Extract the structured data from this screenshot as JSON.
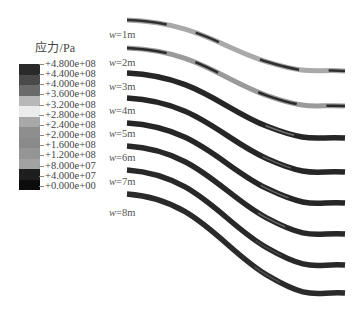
{
  "legend": {
    "title": "应力/Pa",
    "labels": [
      "+4.800e+08",
      "+4.400e+08",
      "+4.000e+08",
      "+3.600e+08",
      "+3.200e+08",
      "+2.800e+08",
      "+2.400e+08",
      "+2.000e+08",
      "+1.600e+08",
      "+1.200e+08",
      "+8.000e+07",
      "+4.000e+07",
      "+0.000e+00"
    ],
    "colors": [
      "#2a2a2a",
      "#4a4a4a",
      "#6a6a6a",
      "#b8b8b8",
      "#ececec",
      "#a8a8a8",
      "#8e8e8e",
      "#8a8a8a",
      "#959595",
      "#a2a2a2",
      "#1e1e1e",
      "#0c0c0c"
    ]
  },
  "strata": [
    {
      "label_var": "w",
      "label_val": "=1m",
      "label_y": 29,
      "y_start": 20,
      "y_end": 71,
      "dominant": "#a9a9a9",
      "accent": "#222222"
    },
    {
      "label_var": "w",
      "label_val": "=2m",
      "label_y": 57,
      "y_start": 48,
      "y_end": 106,
      "dominant": "#9a9a9a",
      "accent": "#1e1e1e"
    },
    {
      "label_var": "w",
      "label_val": "=3m",
      "label_y": 81,
      "y_start": 73,
      "y_end": 138,
      "dominant": "#262626",
      "accent": "#b0b0b0"
    },
    {
      "label_var": "w",
      "label_val": "=4m",
      "label_y": 105,
      "y_start": 98,
      "y_end": 172,
      "dominant": "#262626",
      "accent": "#8c8c8c"
    },
    {
      "label_var": "w",
      "label_val": "=5m",
      "label_y": 128,
      "y_start": 123,
      "y_end": 203,
      "dominant": "#262626",
      "accent": "#9a9a9a"
    },
    {
      "label_var": "w",
      "label_val": "=6m",
      "label_y": 152,
      "y_start": 146,
      "y_end": 234,
      "dominant": "#282828",
      "accent": "#9a9a9a"
    },
    {
      "label_var": "w",
      "label_val": "=7m",
      "label_y": 176,
      "y_start": 170,
      "y_end": 265,
      "dominant": "#282828",
      "accent": "#606060"
    },
    {
      "label_var": "w",
      "label_val": "=8m",
      "label_y": 207,
      "y_start": 194,
      "y_end": 293,
      "dominant": "#2a2a2a",
      "accent": "#707070"
    }
  ]
}
